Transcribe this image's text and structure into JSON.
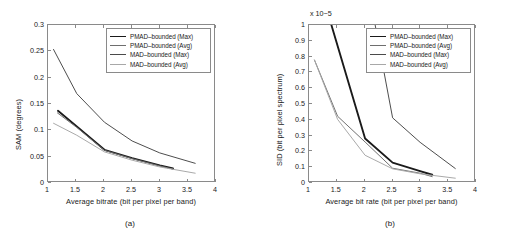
{
  "figure": {
    "panels": [
      {
        "caption": "(a)",
        "legend": [
          {
            "label": "PMAD–bounded (Max)",
            "color": "#1a1a1a",
            "width": 1.9
          },
          {
            "label": "PMAD–bounded (Avg)",
            "color": "#6e6e6e",
            "width": 1.0
          },
          {
            "label": "MAD–bounded (Max)",
            "color": "#4a4a4a",
            "width": 1.0
          },
          {
            "label": "MAD–bounded (Avg)",
            "color": "#a8a8a8",
            "width": 1.0
          }
        ]
      },
      {
        "caption": "(b)",
        "legend": [
          {
            "label": "PMAD–bounded (Max)",
            "color": "#1a1a1a",
            "width": 1.9
          },
          {
            "label": "PMAD–bounded (Avg)",
            "color": "#6e6e6e",
            "width": 1.0
          },
          {
            "label": "MAD–bounded (Max)",
            "color": "#4a4a4a",
            "width": 1.0
          },
          {
            "label": "MAD–bounded (Avg)",
            "color": "#a8a8a8",
            "width": 1.0
          }
        ]
      }
    ]
  },
  "chart_data": [
    {
      "type": "line",
      "panel": "(a)",
      "title": "",
      "xlabel": "Average bitrate (bit per pixel per band)",
      "ylabel": "SAM (degrees)",
      "xlim": [
        1,
        4
      ],
      "ylim": [
        0,
        0.3
      ],
      "xticks": [
        1,
        1.5,
        2,
        2.5,
        3,
        3.5,
        4
      ],
      "xticklabels": [
        "1",
        "1.5",
        "2",
        "2.5",
        "3",
        "3.5",
        "4"
      ],
      "yticks": [
        0,
        0.05,
        0.1,
        0.15,
        0.2,
        0.25,
        0.3
      ],
      "yticklabels": [
        "0",
        "0.05",
        "0.1",
        "0.15",
        "0.2",
        "0.25",
        "0.3"
      ],
      "grid": false,
      "legend_position": "upper right",
      "series": [
        {
          "name": "PMAD–bounded (Max)",
          "color": "#1a1a1a",
          "x": [
            1.18,
            1.52,
            2.02,
            2.52,
            3.02,
            3.26
          ],
          "y": [
            0.135,
            0.105,
            0.06,
            0.044,
            0.03,
            0.024
          ]
        },
        {
          "name": "PMAD–bounded (Avg)",
          "color": "#6e6e6e",
          "x": [
            1.17,
            1.52,
            2.02,
            2.52,
            3.02,
            3.26
          ],
          "y": [
            0.131,
            0.103,
            0.059,
            0.043,
            0.029,
            0.023
          ]
        },
        {
          "name": "MAD–bounded (Max)",
          "color": "#4a4a4a",
          "x": [
            1.1,
            1.52,
            2.02,
            2.52,
            3.02,
            3.66
          ],
          "y": [
            0.253,
            0.168,
            0.113,
            0.077,
            0.054,
            0.034
          ]
        },
        {
          "name": "MAD–bounded (Avg)",
          "color": "#a8a8a8",
          "x": [
            1.1,
            1.52,
            2.02,
            2.52,
            3.02,
            3.66
          ],
          "y": [
            0.111,
            0.088,
            0.056,
            0.04,
            0.027,
            0.015
          ]
        }
      ]
    },
    {
      "type": "line",
      "panel": "(b)",
      "title": "",
      "xlabel": "Average bit rate (bit per pixel per band)",
      "ylabel": "SID (bit per pixel spectrum)",
      "y_multiplier": "x 10−5",
      "xlim": [
        1,
        4
      ],
      "ylim": [
        0,
        1
      ],
      "xticks": [
        1,
        1.5,
        2,
        2.5,
        3,
        3.5,
        4
      ],
      "xticklabels": [
        "1",
        "1.5",
        "2",
        "2.5",
        "3",
        "3.5",
        "4"
      ],
      "yticks": [
        0,
        0.1,
        0.2,
        0.3,
        0.4,
        0.5,
        0.6,
        0.7,
        0.8,
        0.9,
        1
      ],
      "yticklabels": [
        "0",
        "0.1",
        "0.2",
        "0.3",
        "0.4",
        "0.5",
        "0.6",
        "0.7",
        "0.8",
        "0.9",
        "1"
      ],
      "grid": false,
      "legend_position": "upper right",
      "series": [
        {
          "name": "PMAD–bounded (Max)",
          "color": "#1a1a1a",
          "x": [
            1.34,
            2.02,
            2.52,
            3.02,
            3.24
          ],
          "y": [
            1.08,
            0.272,
            0.118,
            0.063,
            0.04
          ]
        },
        {
          "name": "PMAD–bounded (Avg)",
          "color": "#6e6e6e",
          "x": [
            1.1,
            1.52,
            2.02,
            2.52,
            3.02,
            3.24
          ],
          "y": [
            0.775,
            0.415,
            0.25,
            0.082,
            0.05,
            0.028
          ]
        },
        {
          "name": "MAD–bounded (Max)",
          "color": "#4a4a4a",
          "x": [
            2.16,
            2.52,
            3.02,
            3.66
          ],
          "y": [
            1.08,
            0.405,
            0.248,
            0.08
          ]
        },
        {
          "name": "MAD–bounded (Avg)",
          "color": "#a8a8a8",
          "x": [
            1.1,
            1.52,
            2.02,
            2.52,
            3.02,
            3.66
          ],
          "y": [
            0.775,
            0.395,
            0.165,
            0.078,
            0.046,
            0.018
          ]
        }
      ]
    }
  ]
}
